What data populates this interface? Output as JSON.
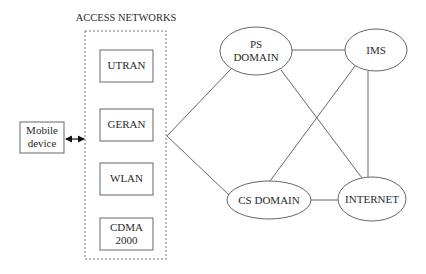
{
  "title": "ACCESS NETWORKS",
  "mobile_device": {
    "label_line1": "Mobile",
    "label_line2": "device"
  },
  "access_networks": [
    {
      "id": "utran",
      "line1": "UTRAN",
      "line2": ""
    },
    {
      "id": "geran",
      "line1": "GERAN",
      "line2": ""
    },
    {
      "id": "wlan",
      "line1": "WLAN",
      "line2": ""
    },
    {
      "id": "cdma2000",
      "line1": "CDMA",
      "line2": "2000"
    }
  ],
  "core_nodes": {
    "ps_domain": {
      "line1": "PS",
      "line2": "DOMAIN"
    },
    "ims": {
      "line1": "IMS"
    },
    "cs_domain": {
      "line1": "CS DOMAIN"
    },
    "internet": {
      "line1": "INTERNET"
    }
  },
  "connections": [
    [
      "access-networks",
      "ps_domain"
    ],
    [
      "access-networks",
      "cs_domain"
    ],
    [
      "ps_domain",
      "ims"
    ],
    [
      "ps_domain",
      "internet"
    ],
    [
      "ims",
      "cs_domain"
    ],
    [
      "ims",
      "internet"
    ],
    [
      "cs_domain",
      "internet"
    ],
    [
      "mobile_device",
      "access-networks"
    ]
  ],
  "colors": {
    "stroke": "#555555",
    "text": "#2a2a2a",
    "dashed": "#777777"
  }
}
